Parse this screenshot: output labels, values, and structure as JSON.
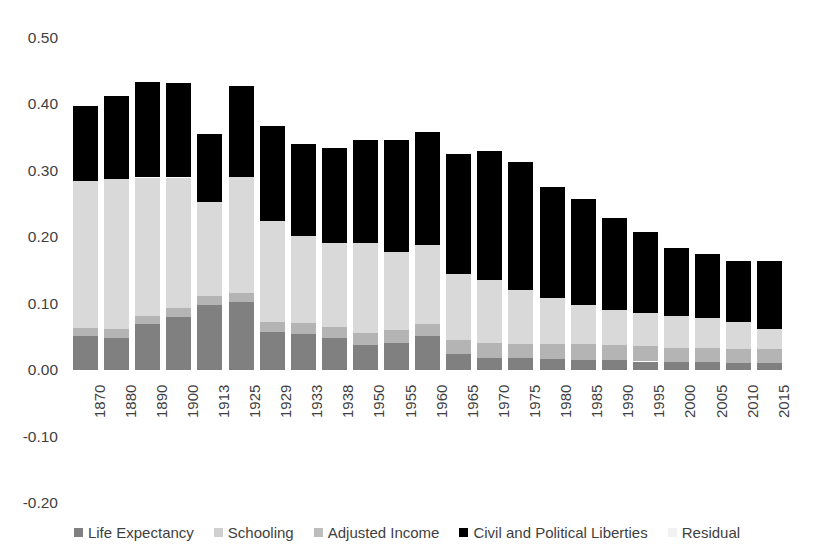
{
  "chart_data": {
    "type": "bar",
    "stacked": true,
    "title": "",
    "subtitle": "",
    "xlabel": "",
    "ylabel": "",
    "ylim": [
      -0.2,
      0.5
    ],
    "ytick_values": [
      0.5,
      0.4,
      0.3,
      0.2,
      0.1,
      0.0,
      -0.1,
      -0.2
    ],
    "ytick_labels": [
      "0.50",
      "0.40",
      "0.30",
      "0.20",
      "0.10",
      "0.00",
      "-0.10",
      "-0.20"
    ],
    "grid": false,
    "legend_position": "bottom",
    "categories": [
      "1870",
      "1880",
      "1890",
      "1900",
      "1913",
      "1925",
      "1929",
      "1933",
      "1938",
      "1950",
      "1955",
      "1960",
      "1965",
      "1970",
      "1975",
      "1980",
      "1985",
      "1990",
      "1995",
      "2000",
      "2005",
      "2010",
      "2015"
    ],
    "series": [
      {
        "name": "Life Expectancy",
        "color": "#808080",
        "values": [
          0.051,
          0.049,
          0.069,
          0.08,
          0.098,
          0.103,
          0.058,
          0.055,
          0.048,
          0.038,
          0.041,
          0.051,
          0.024,
          0.019,
          0.018,
          0.017,
          0.016,
          0.015,
          0.013,
          0.012,
          0.012,
          0.011,
          0.011
        ]
      },
      {
        "name": "Schooling",
        "color": "#b4b4b4",
        "values": [
          0.012,
          0.013,
          0.013,
          0.013,
          0.013,
          0.013,
          0.015,
          0.016,
          0.017,
          0.018,
          0.019,
          0.019,
          0.021,
          0.022,
          0.022,
          0.023,
          0.023,
          0.023,
          0.023,
          0.022,
          0.022,
          0.021,
          0.021
        ]
      },
      {
        "name": "Adjusted Income",
        "color": "#d9d9d9",
        "values": [
          0.222,
          0.226,
          0.208,
          0.197,
          0.142,
          0.175,
          0.151,
          0.131,
          0.126,
          0.135,
          0.118,
          0.118,
          0.1,
          0.094,
          0.08,
          0.068,
          0.059,
          0.053,
          0.05,
          0.047,
          0.044,
          0.04,
          0.03
        ]
      },
      {
        "name": "Civil and Political Liberties",
        "color": "#000000",
        "values": [
          0.113,
          0.124,
          0.144,
          0.142,
          0.102,
          0.136,
          0.143,
          0.139,
          0.143,
          0.155,
          0.168,
          0.17,
          0.181,
          0.195,
          0.193,
          0.167,
          0.16,
          0.138,
          0.122,
          0.103,
          0.097,
          0.093,
          0.102
        ]
      },
      {
        "name": "Residual",
        "color": "#f2f2f2",
        "values": [
          0.0,
          0.0,
          0.0,
          0.0,
          0.0,
          0.0,
          0.0,
          0.0,
          0.0,
          0.0,
          0.0,
          0.0,
          0.0,
          0.0,
          0.0,
          0.0,
          0.0,
          0.0,
          0.0,
          0.0,
          0.0,
          0.0,
          0.0
        ]
      }
    ],
    "totals": [
      0.398,
      0.412,
      0.434,
      0.432,
      0.355,
      0.427,
      0.367,
      0.341,
      0.334,
      0.346,
      0.346,
      0.358,
      0.326,
      0.33,
      0.313,
      0.275,
      0.258,
      0.229,
      0.208,
      0.184,
      0.175,
      0.165,
      0.164
    ]
  },
  "legend": {
    "items": [
      {
        "label": "Life Expectancy",
        "swatch": "life"
      },
      {
        "label": "Schooling",
        "swatch": "school"
      },
      {
        "label": "Adjusted Income",
        "swatch": "income"
      },
      {
        "label": "Civil and Political Liberties",
        "swatch": "liberties"
      },
      {
        "label": "Residual",
        "swatch": "residual"
      }
    ]
  }
}
